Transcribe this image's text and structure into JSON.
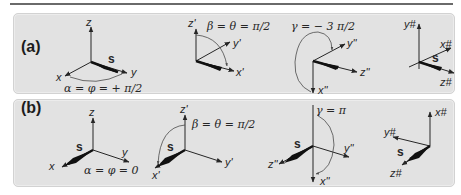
{
  "figure": {
    "panels": [
      {
        "label": "(a)",
        "frames": [
          {
            "axes": [
              "z",
              "y",
              "x"
            ],
            "vector": "s",
            "angle": "α = φ = + π/2"
          },
          {
            "axes": [
              "z'",
              "y'",
              "x'"
            ],
            "angle": "β = θ = π/2"
          },
          {
            "axes": [
              "y''",
              "z''",
              "x''"
            ],
            "angle": "γ = − 3 π/2"
          },
          {
            "axes": [
              "y#",
              "x#",
              "z#"
            ],
            "vector": "s"
          }
        ]
      },
      {
        "label": "(b)",
        "frames": [
          {
            "axes": [
              "z",
              "y",
              "x"
            ],
            "vector": "s",
            "angle": "α = φ = 0"
          },
          {
            "axes": [
              "z'",
              "y'",
              "x'"
            ],
            "vector": "s",
            "angle": "β = θ = π/2"
          },
          {
            "axes": [
              "z''",
              "y''",
              "x''"
            ],
            "vector": "s",
            "angle": "γ = π"
          },
          {
            "axes": [
              "x#",
              "y#",
              "z#"
            ],
            "vector": "s"
          }
        ]
      }
    ],
    "colors": {
      "panel_bg": "#e2e2e2",
      "ink": "#262626",
      "rule": "#6a6a6a"
    }
  }
}
